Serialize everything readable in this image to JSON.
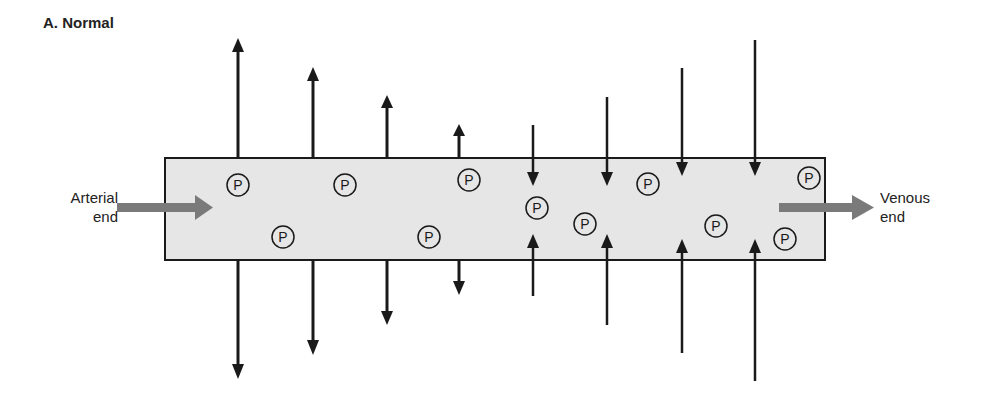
{
  "figure": {
    "title": "A. Normal",
    "arterial_label_line1": "Arterial",
    "arterial_label_line2": "end",
    "venous_label_line1": "Venous",
    "venous_label_line2": "end",
    "protein_symbol": "P",
    "colors": {
      "vessel_fill": "#e6e6e6",
      "flow_arrow": "#7a7a7a",
      "ink": "#1a1a1a"
    }
  }
}
